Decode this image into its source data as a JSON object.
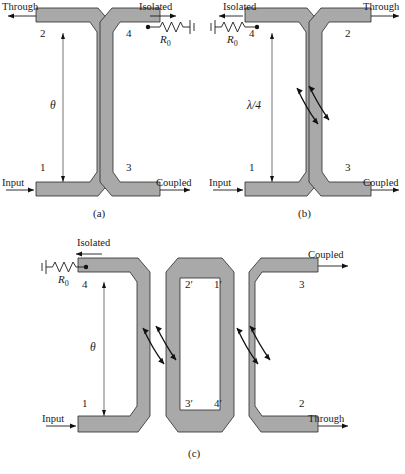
{
  "figure": {
    "type": "coupled-line-coupler-diagram",
    "caption_a": "(a)",
    "caption_b": "(b)",
    "caption_c": "(c)",
    "trace_color": "#a9a9a9",
    "outline_color": "#2a2a2a"
  },
  "panel_a": {
    "caption": "(a)",
    "ports": [
      "1",
      "2",
      "3",
      "4"
    ],
    "port_labels": {
      "p1": "1",
      "p2": "2",
      "p3": "3",
      "p4": "4"
    },
    "signals": {
      "input": "Input",
      "through": "Through",
      "coupled": "Coupled",
      "isolated": "Isolated"
    },
    "termination": "R",
    "termination_sub": "0",
    "length_symbol": "θ"
  },
  "panel_b": {
    "caption": "(b)",
    "ports": [
      "1",
      "2",
      "3",
      "4"
    ],
    "port_labels": {
      "p1": "1",
      "p2": "2",
      "p3": "3",
      "p4": "4"
    },
    "signals": {
      "input": "Input",
      "through": "Through",
      "coupled": "Coupled",
      "isolated": "Isolated"
    },
    "termination": "R",
    "termination_sub": "0",
    "length_symbol": "λ/4"
  },
  "panel_c": {
    "caption": "(c)",
    "ports": [
      "1",
      "2",
      "3",
      "4",
      "1'",
      "2'",
      "3'",
      "4'"
    ],
    "port_labels": {
      "p1": "1",
      "p2": "2",
      "p3": "3",
      "p4": "4",
      "p1p": "1′",
      "p2p": "2′",
      "p3p": "3′",
      "p4p": "4′"
    },
    "signals": {
      "input": "Input",
      "through": "Through",
      "coupled": "Coupled",
      "isolated": "Isolated"
    },
    "termination": "R",
    "termination_sub": "0",
    "length_symbol": "θ"
  }
}
